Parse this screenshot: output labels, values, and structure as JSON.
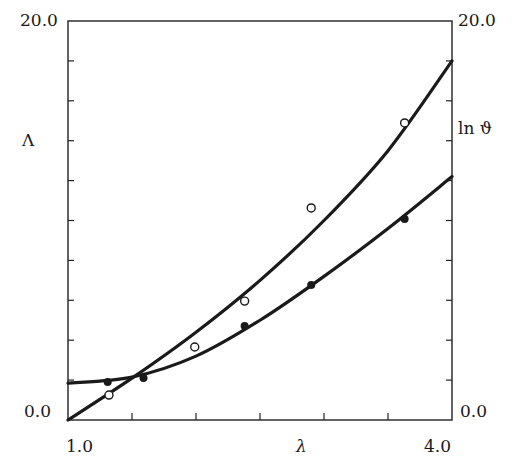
{
  "chart_data": {
    "type": "scatter",
    "title": "",
    "xlabel": "λ",
    "ylabel_left": "Λ",
    "ylabel_right": "ln ϑ",
    "xlim": [
      1.0,
      4.0
    ],
    "ylim_left": [
      0.0,
      20.0
    ],
    "ylim_right": [
      0.0,
      20.0
    ],
    "x_tick_labels": [
      "1.0",
      "4.0"
    ],
    "x_ticks": [
      1.0,
      1.5,
      2.0,
      2.5,
      3.0,
      3.5,
      4.0
    ],
    "y_tick_labels_left": [
      "0.0",
      "20.0"
    ],
    "y_tick_labels_right": [
      "0.0",
      "20.0"
    ],
    "y_ticks": [
      0,
      2,
      4,
      6,
      8,
      10,
      12,
      14,
      16,
      18,
      20
    ],
    "grid": false,
    "legend": "none",
    "series": [
      {
        "name": "ln ϑ (open circles)",
        "marker": "open-circle",
        "points": [
          [
            1.32,
            1.25
          ],
          [
            1.99,
            3.66
          ],
          [
            2.38,
            5.96
          ],
          [
            2.9,
            10.63
          ],
          [
            3.63,
            14.89
          ]
        ],
        "fit_curve": [
          [
            1.0,
            0.0
          ],
          [
            1.5,
            2.1
          ],
          [
            2.0,
            4.4
          ],
          [
            2.5,
            7.0
          ],
          [
            3.0,
            10.0
          ],
          [
            3.5,
            13.5
          ],
          [
            4.0,
            18.0
          ]
        ]
      },
      {
        "name": "Λ (filled circles)",
        "marker": "filled-circle",
        "points": [
          [
            1.31,
            1.9
          ],
          [
            1.59,
            2.11
          ],
          [
            2.38,
            4.71
          ],
          [
            2.9,
            6.77
          ],
          [
            3.63,
            10.08
          ]
        ],
        "fit_curve": [
          [
            1.0,
            1.85
          ],
          [
            1.5,
            2.15
          ],
          [
            2.0,
            3.2
          ],
          [
            2.5,
            5.0
          ],
          [
            3.0,
            7.2
          ],
          [
            3.5,
            9.6
          ],
          [
            4.0,
            12.2
          ]
        ]
      }
    ]
  },
  "labels": {
    "y_left_top": "20.0",
    "y_left_bottom": "0.0",
    "y_right_top": "20.0",
    "y_right_bottom": "0.0",
    "x_left": "1.0",
    "x_right": "4.0",
    "x_axis": "λ",
    "y_left_axis": "Λ",
    "y_right_axis": "ln ϑ"
  }
}
